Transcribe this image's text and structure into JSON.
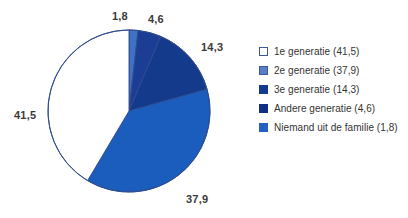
{
  "chart_data": {
    "type": "pie",
    "title": "",
    "subtitle": "",
    "xlabel": "",
    "ylabel": "",
    "units": "percent",
    "legend_position": "right",
    "grid": false,
    "start_angle_deg": 0,
    "direction": "clockwise",
    "total": 100.1,
    "categories": [
      "Niemand uit de familie",
      "Andere generatie",
      "3e generatie",
      "2e generatie",
      "1e generatie"
    ],
    "values": [
      1.8,
      4.6,
      14.3,
      37.9,
      41.5
    ],
    "value_labels": [
      "1,8",
      "4,6",
      "14,3",
      "37,9",
      "41,5"
    ],
    "colors": [
      "#3f71c4",
      "#1b3e94",
      "#143a8c",
      "#1a5dbd",
      "#ffffff"
    ],
    "slices": [
      {
        "name": "Niemand uit de familie",
        "value": 1.8,
        "label": "1,8",
        "color": "#3f71c4",
        "legend_label": "Niemand uit de familie (1,8)",
        "label_x": 112,
        "label_y": 10
      },
      {
        "name": "Andere generatie",
        "value": 4.6,
        "label": "4,6",
        "color": "#1b3e94",
        "legend_label": "Andere generatie (4,6)",
        "label_x": 148,
        "label_y": 13
      },
      {
        "name": "3e generatie",
        "value": 14.3,
        "label": "14,3",
        "color": "#143a8c",
        "legend_label": "3e generatie (14,3)",
        "label_x": 201,
        "label_y": 41
      },
      {
        "name": "2e generatie",
        "value": 37.9,
        "label": "37,9",
        "color": "#1a5dbd",
        "legend_label": "2e generatie (37,9)",
        "label_x": 186,
        "label_y": 193
      },
      {
        "name": "1e generatie",
        "value": 41.5,
        "label": "41,5",
        "color": "#ffffff",
        "legend_label": "1e generatie (41,5)",
        "label_x": 14,
        "label_y": 109
      }
    ],
    "legend": [
      {
        "label": "1e generatie (41,5)",
        "color": "#ffffff",
        "border": "#3a57a0"
      },
      {
        "label": "2e generatie (37,9)",
        "color": "#5a7fc4",
        "border": "#3a57a0"
      },
      {
        "label": "3e generatie (14,3)",
        "color": "#123a8f",
        "border": "#123a8f"
      },
      {
        "label": "Andere generatie (4,6)",
        "color": "#102f82",
        "border": "#102f82"
      },
      {
        "label": "Niemand uit de familie (1,8)",
        "color": "#2360c0",
        "border": "#2360c0"
      }
    ],
    "geometry": {
      "center_x": 129,
      "center_y": 111,
      "radius": 81,
      "outline_color": "#2f4b8f"
    }
  }
}
